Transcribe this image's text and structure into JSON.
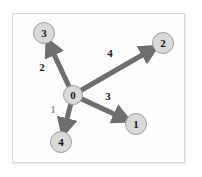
{
  "figure": {
    "kind": "directed-graph-diagram",
    "background_color": "#ffffff",
    "frame": {
      "border_color": "#d8d8d8",
      "fill_color": "#fefefe",
      "x": 12,
      "y": 13,
      "width": 173,
      "height": 150
    }
  },
  "style": {
    "node_fill": "#d9d9d9",
    "node_stroke": "#9e9e9e",
    "node_text_color": "#1a1a1a",
    "edge_color": "#6e6e6e",
    "edge_width": 5,
    "edge_label_color": "#1a1a1a",
    "edge_label_faint_color": "#9a9a9a"
  },
  "graph": {
    "type": "directed",
    "nodes": [
      {
        "id": "0",
        "label": "0",
        "cx": 73,
        "cy": 95,
        "r": 9.5
      },
      {
        "id": "3",
        "label": "3",
        "cx": 44,
        "cy": 33,
        "r": 10.5
      },
      {
        "id": "2",
        "label": "2",
        "cx": 163,
        "cy": 43,
        "r": 10.5
      },
      {
        "id": "1",
        "label": "1",
        "cx": 136,
        "cy": 124,
        "r": 10.5
      },
      {
        "id": "4",
        "label": "4",
        "cx": 61,
        "cy": 142,
        "r": 10.5
      }
    ],
    "edges": [
      {
        "from": "0",
        "to": "3",
        "label": "2",
        "label_x": 42,
        "label_y": 71,
        "faint": false
      },
      {
        "from": "0",
        "to": "2",
        "label": "4",
        "label_x": 110,
        "label_y": 57,
        "faint": false
      },
      {
        "from": "0",
        "to": "1",
        "label": "3",
        "label_x": 108,
        "label_y": 100,
        "faint": false
      },
      {
        "from": "0",
        "to": "4",
        "label": "1",
        "label_x": 53,
        "label_y": 113,
        "faint": true
      }
    ]
  }
}
